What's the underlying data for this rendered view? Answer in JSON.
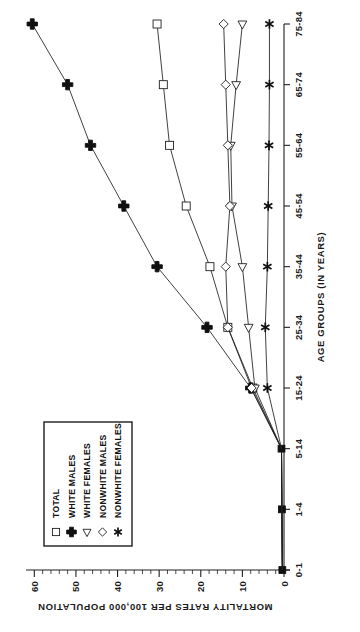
{
  "chart_data": {
    "type": "line",
    "title": "",
    "xlabel": "AGE GROUPS  (IN YEARS)",
    "ylabel": "MORTALITY RATES PER 100,000 POPULATION",
    "categories": [
      "0-1",
      "1-4",
      "5-14",
      "15-24",
      "25-34",
      "35-44",
      "45-54",
      "55-64",
      "65-74",
      "75-84"
    ],
    "ylim": [
      0,
      62
    ],
    "yticks": [
      0,
      10,
      20,
      30,
      40,
      50,
      60
    ],
    "ytick_labels": [
      "0",
      "10",
      "20",
      "30",
      "40",
      "50",
      "60"
    ],
    "minor_ticks_per_interval": 5,
    "grid": false,
    "legend_position": "upper-left-inside",
    "series": [
      {
        "name": "TOTAL",
        "marker": "square-open",
        "values": [
          0.4,
          0.5,
          0.6,
          7.5,
          13.5,
          17.8,
          23.5,
          27.5,
          29.0,
          30.5
        ]
      },
      {
        "name": "WHITE MALES",
        "marker": "plus",
        "values": [
          0.4,
          0.5,
          0.6,
          8.0,
          18.5,
          30.5,
          38.5,
          46.5,
          52.0,
          60.5
        ]
      },
      {
        "name": "WHITE FEMALES",
        "marker": "triangle-left-open",
        "values": [
          0.4,
          0.5,
          0.6,
          7.0,
          8.5,
          10.0,
          12.5,
          12.8,
          11.5,
          10.0
        ]
      },
      {
        "name": "NONWHITE MALES",
        "marker": "diamond-open",
        "values": [
          0.4,
          0.5,
          0.6,
          7.8,
          13.5,
          14.0,
          13.0,
          13.5,
          14.0,
          14.5
        ]
      },
      {
        "name": "NONWHITE FEMALES",
        "marker": "asterisk",
        "values": [
          0.4,
          0.5,
          0.6,
          4.0,
          4.5,
          4.0,
          3.8,
          3.6,
          3.5,
          3.5
        ]
      }
    ]
  },
  "legend": {
    "entries": [
      {
        "label": "TOTAL",
        "marker": "square-open"
      },
      {
        "label": "WHITE MALES",
        "marker": "plus"
      },
      {
        "label": "WHITE FEMALES",
        "marker": "triangle-left-open"
      },
      {
        "label": "NONWHITE MALES",
        "marker": "diamond-open"
      },
      {
        "label": "NONWHITE FEMALES",
        "marker": "asterisk"
      }
    ]
  },
  "colors": {
    "ink": "#1f1f1f",
    "paper": "#ffffff"
  }
}
